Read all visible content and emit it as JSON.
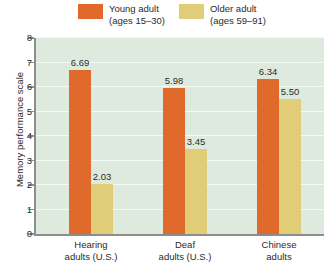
{
  "legend": {
    "entries": [
      {
        "label_line1": "Young adult",
        "label_line2": "(ages 15–30)",
        "color": "#e06a2c",
        "swatch_name": "legend-swatch-young-adult"
      },
      {
        "label_line1": "Older adult",
        "label_line2": "(ages 59–91)",
        "color": "#e1cd78",
        "swatch_name": "legend-swatch-older-adult"
      }
    ]
  },
  "chart_data": {
    "type": "bar",
    "title": "",
    "xlabel": "",
    "ylabel": "Memory performance scale",
    "ylim": [
      0,
      8
    ],
    "yticks": [
      "0",
      "1",
      "2",
      "3",
      "4",
      "5",
      "6",
      "7",
      "8"
    ],
    "grid": true,
    "legend_position": "top",
    "categories": [
      "Hearing adults (U.S.)",
      "Deaf adults (U.S.)",
      "Chinese adults"
    ],
    "categories_wrapped": [
      [
        "Hearing",
        "adults (U.S.)"
      ],
      [
        "Deaf",
        "adults (U.S.)"
      ],
      [
        "Chinese",
        "adults"
      ]
    ],
    "series": [
      {
        "name": "Young adult (ages 15–30)",
        "color": "#e06a2c",
        "values": [
          6.69,
          5.98,
          6.34
        ],
        "labels": [
          "6.69",
          "5.98",
          "6.34"
        ]
      },
      {
        "name": "Older adult (ages 59–91)",
        "color": "#e1cd78",
        "values": [
          2.03,
          3.45,
          5.5
        ],
        "labels": [
          "2.03",
          "3.45",
          "5.50"
        ]
      }
    ],
    "plot_background": "#dfeade",
    "axis_color": "#8d8d8d",
    "gridline_color": "#f4fbf4"
  }
}
